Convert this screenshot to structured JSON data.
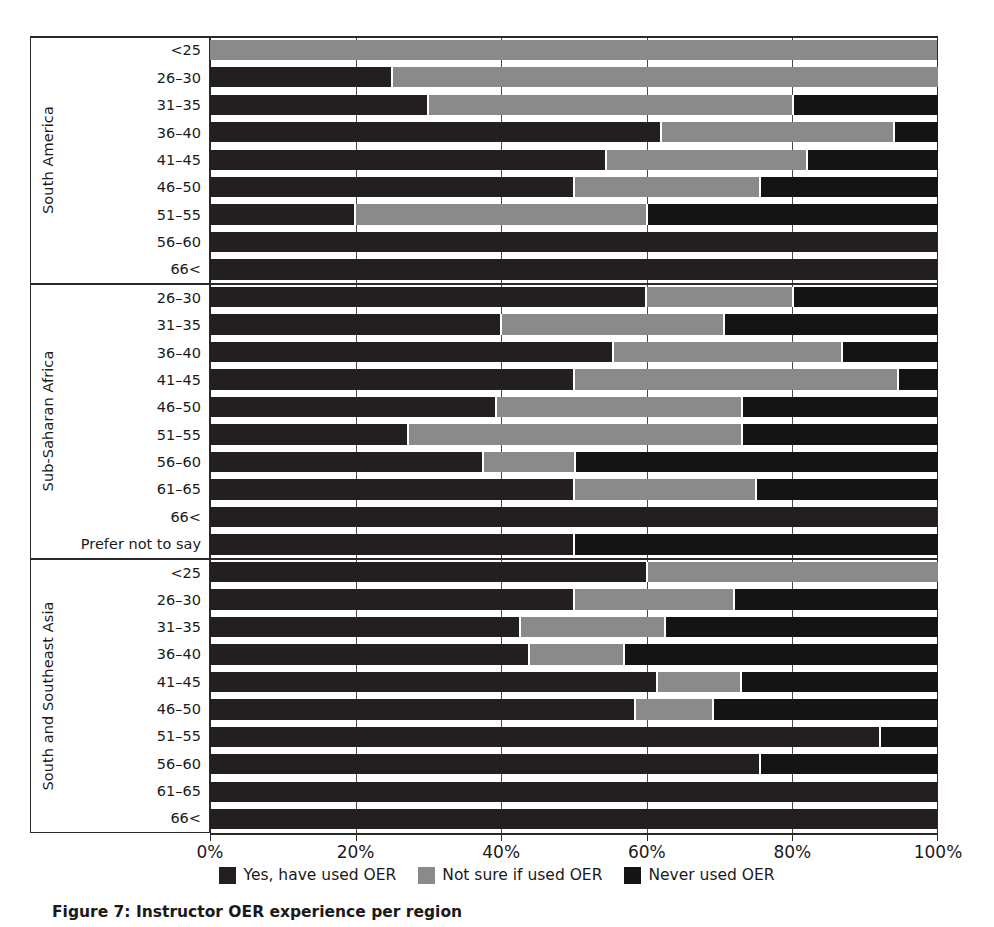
{
  "chart_data": {
    "type": "bar",
    "orientation": "horizontal",
    "stacked": true,
    "stack_mode": "percent",
    "title": "",
    "xlabel": "",
    "ylabel": "",
    "xlim": [
      0,
      100
    ],
    "xticks": [
      0,
      20,
      40,
      60,
      80,
      100
    ],
    "xticklabels": [
      "0%",
      "20%",
      "40%",
      "60%",
      "80%",
      "100%"
    ],
    "grid": "vertical",
    "legend_position": "bottom-center",
    "series": [
      {
        "name": "Yes, have used OER",
        "color": "#231f20"
      },
      {
        "name": "Not sure if used OER",
        "color": "#8a8a8a"
      },
      {
        "name": "Never used OER",
        "color": "#141414"
      }
    ],
    "groups": [
      {
        "region": "South America",
        "categories": [
          "<25",
          "26–30",
          "31–35",
          "36–40",
          "41–45",
          "46–50",
          "51–55",
          "56–60",
          "66<"
        ],
        "values": [
          [
            0,
            100,
            0
          ],
          [
            25,
            75,
            0
          ],
          [
            30,
            50,
            20
          ],
          [
            62,
            32,
            6
          ],
          [
            54.5,
            27.5,
            18
          ],
          [
            50,
            25.5,
            24.5
          ],
          [
            20,
            40,
            40
          ],
          [
            100,
            0,
            0
          ],
          [
            100,
            0,
            0
          ]
        ]
      },
      {
        "region": "Sub-Saharan Africa",
        "categories": [
          "26–30",
          "31–35",
          "36–40",
          "41–45",
          "46–50",
          "51–55",
          "56–60",
          "61–65",
          "66<",
          "Prefer not to say"
        ],
        "values": [
          [
            60,
            20,
            20
          ],
          [
            40,
            30.5,
            29.5
          ],
          [
            55.5,
            31.3,
            13.2
          ],
          [
            50,
            44.5,
            5.5
          ],
          [
            39.4,
            33.6,
            27
          ],
          [
            27.3,
            45.7,
            27
          ],
          [
            37.5,
            12.5,
            50
          ],
          [
            50,
            25,
            25
          ],
          [
            100,
            0,
            0
          ],
          [
            50,
            0,
            50
          ]
        ]
      },
      {
        "region": "South and Southeast Asia",
        "categories": [
          "<25",
          "26–30",
          "31–35",
          "36–40",
          "41–45",
          "46–50",
          "51–55",
          "56–60",
          "61–65",
          "66<"
        ],
        "values": [
          [
            60,
            40,
            0
          ],
          [
            50,
            22,
            28
          ],
          [
            42.6,
            19.9,
            37.5
          ],
          [
            43.9,
            12.9,
            43.2
          ],
          [
            61.5,
            11.4,
            27.1
          ],
          [
            58.4,
            10.6,
            31
          ],
          [
            92,
            0,
            8
          ],
          [
            75.5,
            0,
            24.5
          ],
          [
            100,
            0,
            0
          ],
          [
            100,
            0,
            0
          ]
        ]
      }
    ]
  },
  "legend": {
    "items": [
      {
        "label": "Yes, have used OER",
        "color": "#231f20"
      },
      {
        "label": "Not sure if used OER",
        "color": "#8a8a8a"
      },
      {
        "label": "Never used OER",
        "color": "#141414"
      }
    ]
  },
  "caption": {
    "text": "Figure 7: Instructor OER experience per region"
  }
}
